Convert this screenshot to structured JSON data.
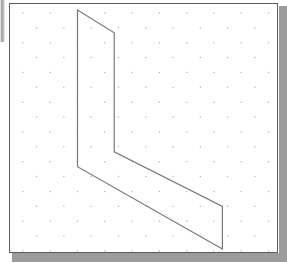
{
  "window": {
    "title": "Isometric Grid Drawing",
    "canvas_label": "isometric-drawing-canvas",
    "background_color": "#ffffff",
    "panel_border_color": "#5d5d5d",
    "shadow_color": "#9b9b9b"
  },
  "left_edge_bar": {
    "label": "scroll-edge-artifact",
    "color": "#9a9a9a"
  },
  "grid": {
    "type": "isometric-dot-grid",
    "dot_color": "#b9b9bd",
    "dot_radius": 0.75,
    "column_spacing": 27.5,
    "row_spacing": 15.0,
    "row_offset": 13.75,
    "origin_x": 13,
    "origin_y": 9
  },
  "chart_data": {
    "type": "line",
    "xlabel": "",
    "ylabel": "",
    "grid": true,
    "legend": "none",
    "xlim": [
      0,
      269
    ],
    "ylim": [
      0,
      250
    ],
    "series": [
      {
        "name": "L-shape outline",
        "closed": true,
        "stroke_color": "#7a7a7a",
        "stroke_width": 1.2,
        "fill": "none",
        "points": [
          [
            68,
            6
          ],
          [
            105,
            29
          ],
          [
            105,
            149
          ],
          [
            214,
            204
          ],
          [
            214,
            247
          ],
          [
            68,
            164
          ]
        ],
        "vertex_labels": [
          "top-apex",
          "upper-right-fold",
          "inner-corner",
          "lower-right-upper",
          "lower-right-bottom",
          "lower-left-fold"
        ]
      }
    ],
    "edges": [
      {
        "name": "top-slope-edge",
        "from": "top-apex",
        "to": "upper-right-fold"
      },
      {
        "name": "right-vertical-upper-edge",
        "from": "upper-right-fold",
        "to": "inner-corner"
      },
      {
        "name": "inner-diagonal-edge",
        "from": "inner-corner",
        "to": "lower-right-upper"
      },
      {
        "name": "right-vertical-lower-edge",
        "from": "lower-right-upper",
        "to": "lower-right-bottom"
      },
      {
        "name": "bottom-diagonal-edge",
        "from": "lower-right-bottom",
        "to": "lower-left-fold"
      },
      {
        "name": "left-vertical-edge",
        "from": "lower-left-fold",
        "to": "top-apex"
      }
    ]
  }
}
